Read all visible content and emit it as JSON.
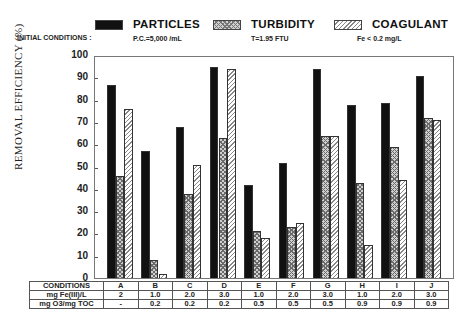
{
  "legend": {
    "initial_conditions_label": "INITIAL CONDITIONS :",
    "items": [
      {
        "label": "PARTICLES",
        "sub": "P.C.=5,000 /mL",
        "pattern": "solid-black"
      },
      {
        "label": "TURBIDITY",
        "sub": "T=1.95 FTU",
        "pattern": "crosshatch"
      },
      {
        "label": "COAGULANT",
        "sub": "Fe < 0.2 mg/L",
        "pattern": "diagonal-hatch"
      }
    ]
  },
  "axis": {
    "ylabel": "REMOVAL EFFICIENCY (%)",
    "yticks": [
      "0",
      "10",
      "20",
      "30",
      "40",
      "50",
      "60",
      "70",
      "80",
      "90",
      "100"
    ]
  },
  "table": {
    "rows": [
      {
        "label": "CONDITIONS",
        "values": [
          "A",
          "B",
          "C",
          "D",
          "E",
          "F",
          "G",
          "H",
          "I",
          "J"
        ]
      },
      {
        "label": "mg Fe(III)/L",
        "values": [
          "2",
          "1.0",
          "2.0",
          "3.0",
          "1.0",
          "2.0",
          "3.0",
          "1.0",
          "2.0",
          "3.0"
        ]
      },
      {
        "label": "mg O3/mg TOC",
        "values": [
          "-",
          "0.2",
          "0.2",
          "0.2",
          "0.5",
          "0.5",
          "0.5",
          "0.9",
          "0.9",
          "0.9"
        ]
      }
    ]
  },
  "chart_data": {
    "type": "bar",
    "title": "",
    "xlabel": "CONDITIONS",
    "ylabel": "REMOVAL EFFICIENCY (%)",
    "ylim": [
      0,
      100
    ],
    "grid": false,
    "legend_position": "top",
    "categories": [
      "A",
      "B",
      "C",
      "D",
      "E",
      "F",
      "G",
      "H",
      "I",
      "J"
    ],
    "series": [
      {
        "name": "PARTICLES",
        "values": [
          87,
          57,
          68,
          95,
          42,
          52,
          94,
          78,
          79,
          91
        ]
      },
      {
        "name": "TURBIDITY",
        "values": [
          46,
          8,
          38,
          63,
          21,
          23,
          64,
          43,
          59,
          72
        ]
      },
      {
        "name": "COAGULANT",
        "values": [
          76,
          2,
          51,
          94,
          18,
          25,
          64,
          15,
          44,
          71
        ]
      }
    ],
    "conditions": {
      "mg Fe(III)/L": [
        "2",
        "1.0",
        "2.0",
        "3.0",
        "1.0",
        "2.0",
        "3.0",
        "1.0",
        "2.0",
        "3.0"
      ],
      "mg O3/mg TOC": [
        "-",
        "0.2",
        "0.2",
        "0.2",
        "0.5",
        "0.5",
        "0.5",
        "0.9",
        "0.9",
        "0.9"
      ]
    },
    "initial_conditions": {
      "PARTICLES": "P.C.=5,000 /mL",
      "TURBIDITY": "T=1.95 FTU",
      "COAGULANT": "Fe < 0.2 mg/L"
    }
  }
}
